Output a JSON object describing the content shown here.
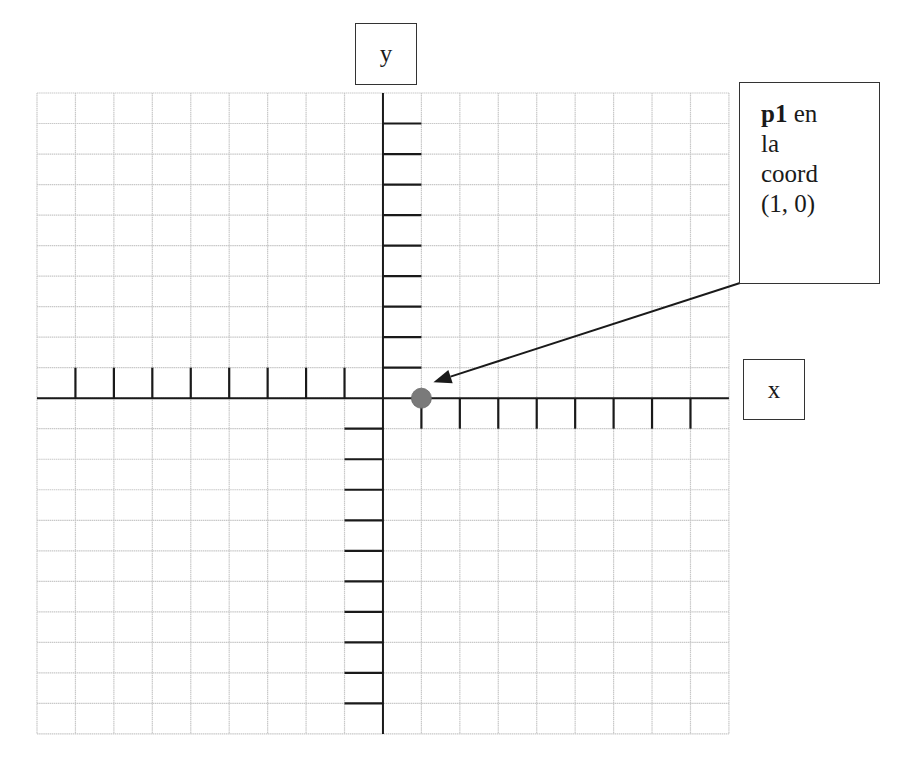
{
  "diagram": {
    "title": "",
    "axes": {
      "x_label": "x",
      "y_label": "y"
    },
    "grid": {
      "left": 37,
      "top": 93,
      "columns": 18,
      "rows": 21,
      "cell_width": 38.44,
      "cell_height": 30.52,
      "y_axis_column": 9,
      "x_axis_row": 10,
      "grid_color": "#c8c8c8",
      "axis_color": "#1a1a1a"
    },
    "ticks": {
      "x_negative_count": 8,
      "x_positive_count": 8,
      "y_positive_count": 9,
      "y_negative_count": 10
    },
    "point": {
      "name": "p1",
      "coord": [
        1,
        0
      ],
      "color": "#7a7a7a",
      "radius": 10
    },
    "callout": {
      "bold": "p1",
      "line1_rest": " en",
      "line2": "la",
      "line3": "coord",
      "line4": "(1, 0)"
    }
  }
}
